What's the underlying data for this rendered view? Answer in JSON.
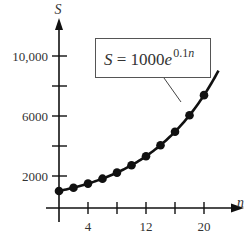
{
  "chart_data": {
    "type": "line",
    "title": "",
    "xlabel": "n",
    "ylabel": "S",
    "equation_label": {
      "lhs": "S",
      "eq": "=",
      "coef": "1000e",
      "exp": "0.1n"
    },
    "x_ticks": [
      0,
      4,
      8,
      12,
      16,
      20
    ],
    "x_tick_labels": [
      "4",
      "12",
      "20"
    ],
    "x_tick_labels_at": [
      4,
      12,
      20
    ],
    "y_ticks": [
      2000,
      4000,
      6000,
      8000,
      10000
    ],
    "y_tick_labels": [
      "2000",
      "6000",
      "10,000"
    ],
    "y_tick_labels_at": [
      2000,
      6000,
      10000
    ],
    "xlim": [
      0,
      22
    ],
    "ylim": [
      0,
      11000
    ],
    "grid": false,
    "series": [
      {
        "name": "S = 1000e^{0.1n}",
        "markers": true,
        "x": [
          0,
          2,
          4,
          6,
          8,
          10,
          12,
          14,
          16,
          18,
          20
        ],
        "values": [
          1000,
          1221,
          1492,
          1822,
          2226,
          2718,
          3320,
          4055,
          4953,
          6050,
          7389
        ]
      }
    ],
    "curve_extends_to_n": 22
  },
  "colors": {
    "ink": "#111111",
    "text": "#333333",
    "box_border": "#555555"
  }
}
